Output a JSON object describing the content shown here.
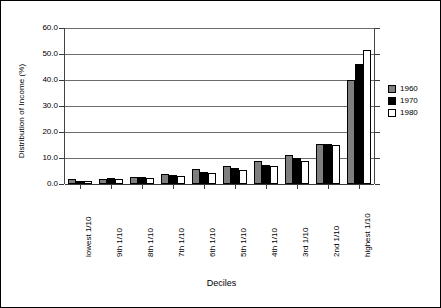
{
  "chart_data": {
    "type": "bar",
    "title": "",
    "xlabel": "Deciles",
    "ylabel": "Distribution of Income (%)",
    "ylim": [
      0,
      60
    ],
    "ytick_values": [
      60.0,
      50.0,
      40.0,
      30.0,
      20.0,
      10.0,
      0.0
    ],
    "ytick_labels": [
      "60.0",
      "50.0",
      "40.0",
      "30.0",
      "20.0",
      "10.0",
      "0.0"
    ],
    "grid": true,
    "legend_position": "right",
    "categories": [
      "lowest 1/10",
      "9th 1/10",
      "8th 1/10",
      "7th 1/10",
      "6th 1/10",
      "5th 1/10",
      "4th 1/10",
      "3rd 1/10",
      "2nd 1/10",
      "highest 1/10"
    ],
    "series": [
      {
        "name": "1960",
        "color": "#7f7f7f",
        "values": [
          1.8,
          2.0,
          2.8,
          4.0,
          5.8,
          7.0,
          9.0,
          11.0,
          15.5,
          40.0
        ]
      },
      {
        "name": "1970",
        "color": "#000000",
        "values": [
          1.0,
          2.2,
          2.8,
          3.5,
          4.5,
          6.0,
          7.5,
          10.0,
          15.5,
          46.2
        ]
      },
      {
        "name": "1980",
        "color": "#ffffff",
        "values": [
          1.0,
          1.8,
          2.5,
          3.0,
          4.2,
          5.2,
          6.8,
          9.0,
          15.0,
          51.5
        ]
      }
    ]
  },
  "legend": {
    "entries": [
      {
        "label": "1960",
        "color": "#7f7f7f"
      },
      {
        "label": "1970",
        "color": "#000000"
      },
      {
        "label": "1980",
        "color": "#ffffff"
      }
    ]
  },
  "axes": {
    "y_title": "Distribution of Income (%)",
    "x_title": "Deciles"
  }
}
